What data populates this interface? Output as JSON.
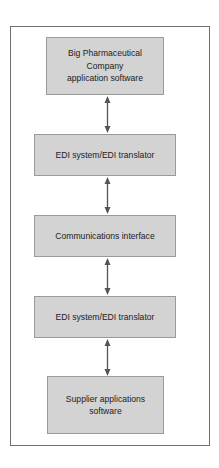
{
  "diagram": {
    "type": "flowchart",
    "direction": "vertical",
    "nodes": [
      {
        "id": "n1",
        "label": "Big Pharmaceutical Company application software"
      },
      {
        "id": "n2",
        "label": "EDI system/EDI translator"
      },
      {
        "id": "n3",
        "label": "Communications interface"
      },
      {
        "id": "n4",
        "label": "EDI system/EDI translator"
      },
      {
        "id": "n5",
        "label": "Supplier applications software"
      }
    ],
    "edges": [
      {
        "from": "n1",
        "to": "n2",
        "style": "bidirectional-arrow"
      },
      {
        "from": "n2",
        "to": "n3",
        "style": "bidirectional-arrow"
      },
      {
        "from": "n3",
        "to": "n4",
        "style": "bidirectional-arrow"
      },
      {
        "from": "n4",
        "to": "n5",
        "style": "bidirectional-arrow"
      }
    ],
    "colors": {
      "box_fill": "#d3d3d3",
      "box_border": "#9a9a9a",
      "arrow": "#555555",
      "frame_border": "#6e6e6e"
    }
  },
  "labels": {
    "n1_line1": "Big Pharmaceutical",
    "n1_line2": "Company",
    "n1_line3": "application software",
    "n2": "EDI system/EDI translator",
    "n3": "Communications interface",
    "n4": "EDI system/EDI translator",
    "n5_line1": "Supplier applications",
    "n5_line2": "software"
  }
}
